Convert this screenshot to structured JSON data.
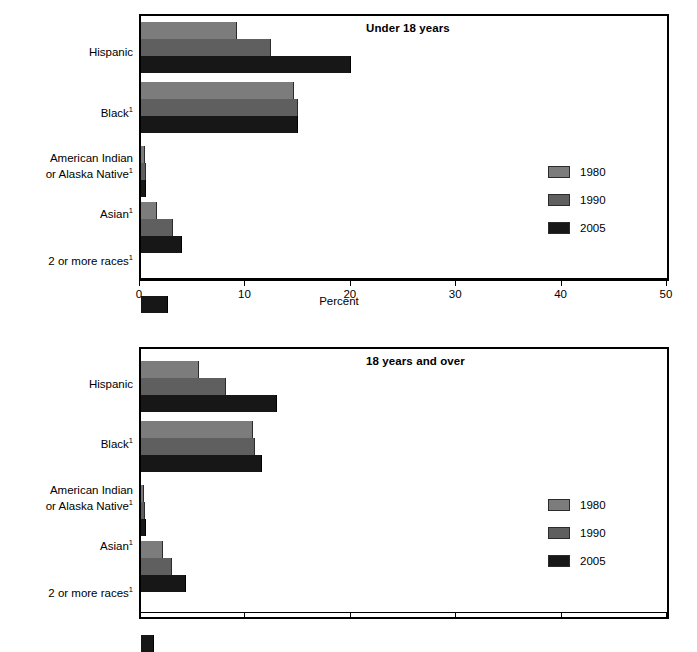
{
  "axis": {
    "xlabel": "Percent",
    "ticks": [
      0,
      10,
      20,
      30,
      40,
      50
    ],
    "tick_labels": [
      "0",
      "10",
      "20",
      "30",
      "40",
      "50"
    ],
    "xmin": 0,
    "xmax": 50
  },
  "legend": {
    "position": "right-middle",
    "entries": [
      {
        "label": "1980",
        "color": "#7c7c7c"
      },
      {
        "label": "1990",
        "color": "#5f5f5f"
      },
      {
        "label": "2005",
        "color": "#171717"
      }
    ]
  },
  "categories": [
    {
      "line1": "Hispanic",
      "line2": "",
      "sup": ""
    },
    {
      "line1": "Black",
      "line2": "",
      "sup": "1"
    },
    {
      "line1": "American Indian",
      "line2": "or Alaska Native",
      "sup": "1"
    },
    {
      "line1": "Asian",
      "line2": "",
      "sup": "1"
    },
    {
      "line1": "2 or more races",
      "line2": "",
      "sup": "1"
    }
  ],
  "panels": [
    {
      "id": "top",
      "title": "Under 18 years"
    },
    {
      "id": "bottom",
      "title": "18 years and over"
    }
  ],
  "chart_data": [
    {
      "type": "bar",
      "orientation": "horizontal",
      "title": "Under 18 years",
      "xlabel": "Percent",
      "ylabel": "",
      "xlim": [
        0,
        50
      ],
      "grid": false,
      "legend_position": "right",
      "categories": [
        "Hispanic",
        "Black1",
        "American Indian or Alaska Native1",
        "Asian1",
        "2 or more races1"
      ],
      "series": [
        {
          "name": "1980",
          "color": "#7c7c7c",
          "values": [
            9.1,
            14.5,
            0.4,
            1.5,
            0.0
          ]
        },
        {
          "name": "1990",
          "color": "#5f5f5f",
          "values": [
            12.3,
            14.9,
            0.5,
            3.0,
            0.0
          ]
        },
        {
          "name": "2005",
          "color": "#171717",
          "values": [
            19.9,
            14.9,
            0.5,
            3.9,
            2.6
          ]
        }
      ]
    },
    {
      "type": "bar",
      "orientation": "horizontal",
      "title": "18 years and over",
      "xlabel": "Percent",
      "ylabel": "",
      "xlim": [
        0,
        50
      ],
      "grid": false,
      "legend_position": "right",
      "categories": [
        "Hispanic",
        "Black1",
        "American Indian or Alaska Native1",
        "Asian1",
        "2 or more races1"
      ],
      "series": [
        {
          "name": "1980",
          "color": "#7c7c7c",
          "values": [
            5.5,
            10.6,
            0.3,
            2.1,
            0.0
          ]
        },
        {
          "name": "1990",
          "color": "#5f5f5f",
          "values": [
            8.1,
            10.8,
            0.4,
            2.9,
            0.0
          ]
        },
        {
          "name": "2005",
          "color": "#171717",
          "values": [
            12.9,
            11.5,
            0.5,
            4.3,
            1.2
          ]
        }
      ]
    }
  ]
}
